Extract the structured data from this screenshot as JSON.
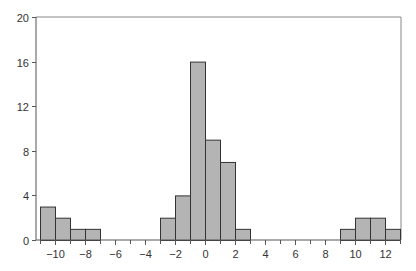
{
  "chart_data": {
    "type": "bar",
    "subtype": "histogram",
    "title": "",
    "xlabel": "",
    "ylabel": "",
    "bin_width": 1,
    "bins": [
      {
        "start": -11,
        "end": -10,
        "count": 3
      },
      {
        "start": -10,
        "end": -9,
        "count": 2
      },
      {
        "start": -9,
        "end": -8,
        "count": 1
      },
      {
        "start": -8,
        "end": -7,
        "count": 1
      },
      {
        "start": -7,
        "end": -6,
        "count": 0
      },
      {
        "start": -6,
        "end": -5,
        "count": 0
      },
      {
        "start": -5,
        "end": -4,
        "count": 0
      },
      {
        "start": -4,
        "end": -3,
        "count": 0
      },
      {
        "start": -3,
        "end": -2,
        "count": 2
      },
      {
        "start": -2,
        "end": -1,
        "count": 4
      },
      {
        "start": -1,
        "end": 0,
        "count": 16
      },
      {
        "start": 0,
        "end": 1,
        "count": 9
      },
      {
        "start": 1,
        "end": 2,
        "count": 7
      },
      {
        "start": 2,
        "end": 3,
        "count": 1
      },
      {
        "start": 3,
        "end": 4,
        "count": 0
      },
      {
        "start": 4,
        "end": 5,
        "count": 0
      },
      {
        "start": 5,
        "end": 6,
        "count": 0
      },
      {
        "start": 6,
        "end": 7,
        "count": 0
      },
      {
        "start": 7,
        "end": 8,
        "count": 0
      },
      {
        "start": 8,
        "end": 9,
        "count": 0
      },
      {
        "start": 9,
        "end": 10,
        "count": 1
      },
      {
        "start": 10,
        "end": 11,
        "count": 2
      },
      {
        "start": 11,
        "end": 12,
        "count": 2
      },
      {
        "start": 12,
        "end": 13,
        "count": 1
      }
    ],
    "xlim": [
      -11,
      13
    ],
    "ylim": [
      0,
      20
    ],
    "x_ticks": [
      -10,
      -8,
      -6,
      -4,
      -2,
      0,
      2,
      4,
      6,
      8,
      10,
      12
    ],
    "x_minor_ticks": [
      -11,
      -9,
      -7,
      -5,
      -3,
      -1,
      1,
      3,
      5,
      7,
      9,
      11,
      13
    ],
    "x_tick_labels": [
      "−10",
      "−8",
      "−6",
      "−4",
      "−2",
      "0",
      "2",
      "4",
      "6",
      "8",
      "10",
      "12"
    ],
    "y_ticks": [
      0,
      4,
      8,
      12,
      16,
      20
    ],
    "y_tick_labels": [
      "0",
      "4",
      "8",
      "12",
      "16",
      "20"
    ],
    "grid": false,
    "legend": null,
    "colors": {
      "bar_fill": "#b4b4b4",
      "bar_edge": "#333333",
      "axis": "#555555",
      "frame": "#888888"
    }
  }
}
